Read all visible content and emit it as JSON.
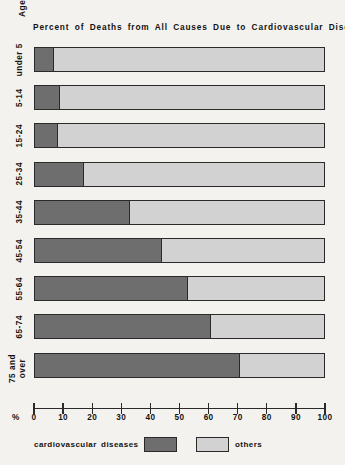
{
  "chart_data": {
    "type": "bar",
    "orientation": "horizontal",
    "stacked": true,
    "normalized": true,
    "title": "Percent of Deaths from All Causes Due to Cardiovascular Diseases",
    "xlabel": "%",
    "ylabel": "Age",
    "xlim": [
      0,
      100
    ],
    "xticks": [
      0,
      10,
      20,
      30,
      40,
      50,
      60,
      70,
      80,
      90,
      100
    ],
    "xtick_labels": [
      "0",
      "10",
      "20",
      "30",
      "40",
      "50",
      "60",
      "70",
      "80",
      "90",
      "100"
    ],
    "grid": false,
    "legend_position": "bottom",
    "categories": [
      "under 5",
      "5-14",
      "15-24",
      "25-34",
      "35-44",
      "45-54",
      "55-64",
      "65-74",
      "75 and over"
    ],
    "series": [
      {
        "name": "cardiovascular diseases",
        "color": "#6e6e6e",
        "values": [
          6.5,
          8.5,
          8,
          17,
          33,
          44,
          53,
          61,
          71
        ]
      },
      {
        "name": "others",
        "color": "#d2d2d2",
        "values": [
          93.5,
          91.5,
          92,
          83,
          67,
          56,
          47,
          39,
          29
        ]
      }
    ]
  },
  "legend": {
    "primary_label": "cardiovascular diseases",
    "secondary_label": "others"
  },
  "colors": {
    "primary": "#6e6e6e",
    "secondary": "#d2d2d2",
    "outline": "#2a2a2a",
    "background": "#f3f2ef"
  }
}
